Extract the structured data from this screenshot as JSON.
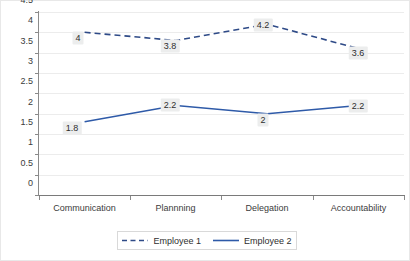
{
  "chart_data": {
    "type": "line",
    "title": "",
    "xlabel": "",
    "ylabel": "",
    "ylim": [
      0,
      4.5
    ],
    "ytick_step": 0.5,
    "grid": true,
    "legend_position": "bottom",
    "categories": [
      "Communication",
      "Plannning",
      "Delegation",
      "Accountability"
    ],
    "yticks": [
      "0",
      "0.5",
      "1",
      "1.5",
      "2",
      "2.5",
      "3",
      "3.5",
      "4",
      "4.5"
    ],
    "series": [
      {
        "name": "Employee 1",
        "style": "dashed",
        "color": "#2e4a87",
        "values": [
          4,
          3.8,
          4.2,
          3.6
        ],
        "labels": [
          "4",
          "3.8",
          "4.2",
          "3.6"
        ]
      },
      {
        "name": "Employee 2",
        "style": "solid",
        "color": "#2e5aa8",
        "values": [
          1.8,
          2.2,
          2,
          2.2
        ],
        "labels": [
          "1.8",
          "2.2",
          "2",
          "2.2"
        ]
      }
    ]
  },
  "colors": {
    "series1": "#2e4a87",
    "series2": "#2e5aa8",
    "grid": "#ececec",
    "axis": "#8a8a8a",
    "label_box": "#eceded",
    "text": "#2e2e2e"
  },
  "legend": {
    "items": [
      {
        "label": "Employee 1"
      },
      {
        "label": "Employee 2"
      }
    ]
  }
}
